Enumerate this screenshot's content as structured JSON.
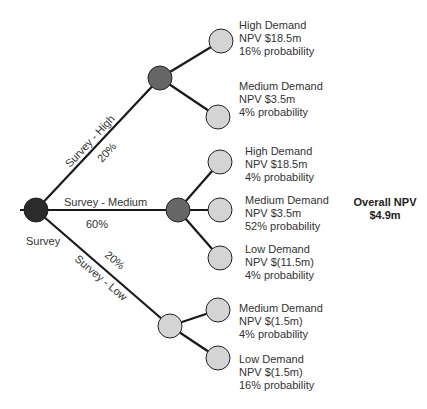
{
  "root": {
    "label": "Survey",
    "color": "#2b2b2b"
  },
  "branches": [
    {
      "name": "Survey - High",
      "probability": "20%",
      "node_color": "#666666"
    },
    {
      "name": "Survey - Medium",
      "probability": "60%",
      "node_color": "#666666"
    },
    {
      "name": "Survey - Low",
      "probability": "20%",
      "node_color": "#cccccc"
    }
  ],
  "outcomes": [
    {
      "demand": "High Demand",
      "npv": "NPV $18.5m",
      "probability": "16% probability"
    },
    {
      "demand": "Medium Demand",
      "npv": "NPV $3.5m",
      "probability": "4% probability"
    },
    {
      "demand": "High Demand",
      "npv": "NPV $18.5m",
      "probability": "4% probability"
    },
    {
      "demand": "Medium Demand",
      "npv": "NPV $3.5m",
      "probability": "52% probability"
    },
    {
      "demand": "Low Demand",
      "npv": "NPV $(11.5m)",
      "probability": "4% probability"
    },
    {
      "demand": "Medium Demand",
      "npv": "NPV $(1.5m)",
      "probability": "4% probability"
    },
    {
      "demand": "Low Demand",
      "npv": "NPV $(1.5m)",
      "probability": "16% probability"
    }
  ],
  "summary": {
    "title": "Overall NPV",
    "value": "$4.9m"
  },
  "colors": {
    "leaf": "#d4d4d4",
    "line": "#1a1a1a"
  }
}
